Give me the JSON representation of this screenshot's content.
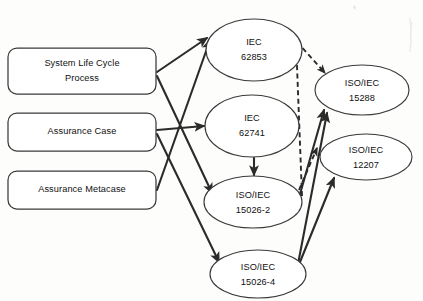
{
  "diagram": {
    "background_color": "#fdfdfc",
    "stroke_color": "#2b2b2b",
    "shape_stroke_color": "#3a3a3a",
    "shape_fill_color": "#ffffff",
    "boxes": [
      {
        "id": "system-life-cycle-process",
        "line1": "System Life Cycle",
        "line2": "Process",
        "x": 8,
        "y": 48,
        "w": 148,
        "h": 46,
        "rx": 9
      },
      {
        "id": "assurance-case",
        "line1": "Assurance Case",
        "line2": "",
        "x": 8,
        "y": 113,
        "w": 148,
        "h": 38,
        "rx": 9
      },
      {
        "id": "assurance-metacase",
        "line1": "Assurance Metacase",
        "line2": "",
        "x": 8,
        "y": 171,
        "w": 148,
        "h": 38,
        "rx": 9
      }
    ],
    "ellipses": [
      {
        "id": "iec-62853",
        "line1": "IEC",
        "line2": "62853",
        "cx": 254,
        "cy": 50,
        "rx": 48,
        "ry": 31
      },
      {
        "id": "iec-62741",
        "line1": "IEC",
        "line2": "62741",
        "cx": 252,
        "cy": 126,
        "rx": 47,
        "ry": 31
      },
      {
        "id": "iso-iec-15026-2",
        "line1": "ISO/IEC",
        "line2": "15026-2",
        "cx": 253,
        "cy": 202,
        "rx": 49,
        "ry": 26
      },
      {
        "id": "iso-iec-15026-4",
        "line1": "ISO/IEC",
        "line2": "15026-4",
        "cx": 258,
        "cy": 274,
        "rx": 48,
        "ry": 24
      },
      {
        "id": "iso-iec-15288",
        "line1": "ISO/IEC",
        "line2": "15288",
        "cx": 362,
        "cy": 90,
        "rx": 47,
        "ry": 25
      },
      {
        "id": "iso-iec-12207",
        "line1": "ISO/IEC",
        "line2": "12207",
        "cx": 366,
        "cy": 157,
        "rx": 46,
        "ry": 23
      }
    ],
    "edges": [
      {
        "id": "slcp-to-62853",
        "from": "system-life-cycle-process",
        "to": "iec-62853",
        "style": "solid",
        "arrow": "end"
      },
      {
        "id": "slcp-to-15026-2",
        "from": "system-life-cycle-process",
        "to": "iso-iec-15026-2",
        "style": "solid",
        "arrow": "end"
      },
      {
        "id": "ac-to-62741",
        "from": "assurance-case",
        "to": "iec-62741",
        "style": "solid",
        "arrow": "end"
      },
      {
        "id": "ac-to-15026-4",
        "from": "assurance-case",
        "to": "iso-iec-15026-4",
        "style": "solid",
        "arrow": "end"
      },
      {
        "id": "amc-to-62853",
        "from": "assurance-metacase",
        "to": "iec-62853",
        "style": "solid",
        "arrow": "end"
      },
      {
        "id": "62741-to-15026-2",
        "from": "iec-62741",
        "to": "iso-iec-15026-2",
        "style": "solid",
        "arrow": "end"
      },
      {
        "id": "62853-to-15288",
        "from": "iec-62853",
        "to": "iso-iec-15288",
        "style": "dashed",
        "arrow": "end"
      },
      {
        "id": "15026-2-to-62853",
        "from": "iso-iec-15026-2",
        "to": "iec-62853",
        "style": "dashed",
        "arrow": "end"
      },
      {
        "id": "15026-2-to-12207",
        "from": "iso-iec-15026-2",
        "to": "iso-iec-12207",
        "style": "dashed",
        "arrow": "end"
      },
      {
        "id": "15026-2-to-15288",
        "from": "iso-iec-15026-2",
        "to": "iso-iec-15288",
        "style": "solid",
        "arrow": "end"
      },
      {
        "id": "15026-4-to-15288",
        "from": "iso-iec-15026-4",
        "to": "iso-iec-15288",
        "style": "solid",
        "arrow": "end"
      },
      {
        "id": "15026-4-to-12207",
        "from": "iso-iec-15026-4",
        "to": "iso-iec-12207",
        "style": "solid",
        "arrow": "end"
      }
    ]
  }
}
